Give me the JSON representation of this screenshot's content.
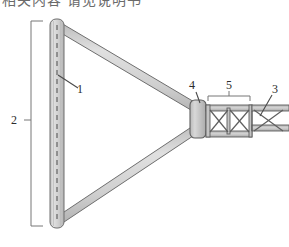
{
  "figure": {
    "title_fragment": "相关内容 请见说明书",
    "background_color": "#ffffff",
    "width": 289,
    "height": 247
  },
  "palette": {
    "member_fill": "#c9c9c9",
    "member_fill_light": "#dcdcdc",
    "member_stroke": "#6e6e6e",
    "truss_fill": "#b9b9b9",
    "line_color": "#555555",
    "label_color": "#2b2b2b",
    "centerline_color": "#4a4a4a"
  },
  "callouts": [
    {
      "id": "1",
      "label": "1",
      "target": "mast-centerline"
    },
    {
      "id": "2",
      "label": "2",
      "target": "mast-overall-extent"
    },
    {
      "id": "3",
      "label": "3",
      "target": "end-truss-panel"
    },
    {
      "id": "4",
      "label": "4",
      "target": "hub-connector"
    },
    {
      "id": "5",
      "label": "5",
      "target": "truss-panel-span"
    }
  ],
  "parts": {
    "mast": {
      "name": "vertical-mast",
      "has_centerline": true
    },
    "arm_upper": {
      "name": "upper-diagonal-arm"
    },
    "arm_lower": {
      "name": "lower-diagonal-arm"
    },
    "hub": {
      "name": "hub-connector"
    },
    "truss": {
      "name": "lattice-truss",
      "panel_count": 3,
      "bracing": "X"
    }
  },
  "brackets": {
    "left": {
      "name": "extent-bracket-2",
      "label": "2"
    },
    "top": {
      "name": "span-bracket-5",
      "label": "5"
    }
  }
}
